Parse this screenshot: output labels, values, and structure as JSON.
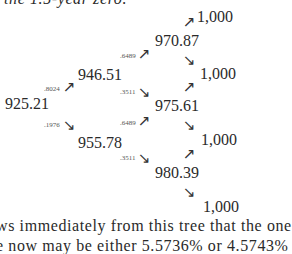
{
  "text": {
    "top_line": "the 1.5-year zero.",
    "bottom_line_1": "ws immediately from this tree that the one",
    "bottom_line_2": "e now may be either 5.5736% or 4.5743%"
  },
  "tree": {
    "root": "925.21",
    "t1": {
      "up": "946.51",
      "down": "955.78"
    },
    "t2": {
      "uu": "970.87",
      "mid": "975.61",
      "dd": "980.39"
    },
    "t3": [
      "1,000",
      "1,000",
      "1,000",
      "1,000",
      "1,000"
    ],
    "probabilities": {
      "root_up": ".8024",
      "root_down": ".1976",
      "t1_up_up": ".6489",
      "t1_up_down": ".3511",
      "t1_down_up": ".6489",
      "t1_down_down": ".3511"
    },
    "arrows": {
      "up": "↗",
      "down": "↘"
    }
  }
}
